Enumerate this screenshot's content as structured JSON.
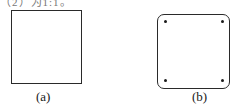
{
  "header": {
    "partial_text": "（2）为1:1。"
  },
  "figures": [
    {
      "id": "a",
      "label": "(a)",
      "shape": "square",
      "corner_dots": 0
    },
    {
      "id": "b",
      "label": "(b)",
      "shape": "rounded-square",
      "corner_dots": 4
    }
  ],
  "colors": {
    "stroke": "#2a2a2a",
    "background": "#ffffff"
  }
}
